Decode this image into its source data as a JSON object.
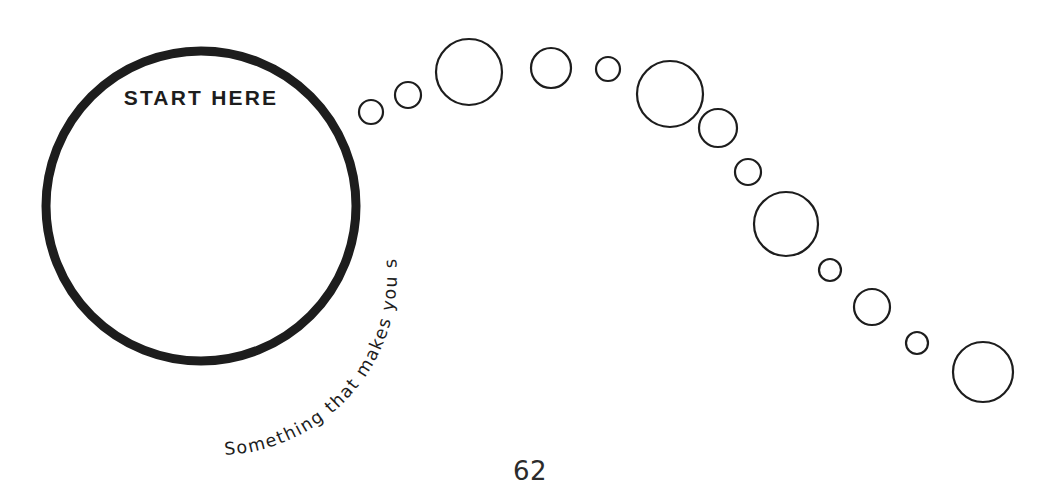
{
  "page": {
    "background_color": "#ffffff",
    "ink_color": "#1d1d1d",
    "page_number": "62"
  },
  "start_circle": {
    "label": "START HERE",
    "caption": "Something that makes you smile",
    "cx": 201,
    "cy": 206,
    "r": 155,
    "stroke_width": 9
  },
  "chart_data": {
    "type": "scatter",
    "title": "Something that makes you smile",
    "xlabel": "",
    "ylabel": "",
    "xlim": [
      0,
      1061
    ],
    "ylim": [
      0,
      500
    ],
    "grid": false,
    "legend": "none",
    "annotations": [
      "START HERE",
      "Something that makes you smile",
      "62"
    ],
    "series": [
      {
        "name": "start-circle",
        "points": [
          {
            "x": 201,
            "y": 206,
            "r": 155,
            "stroke": 9
          }
        ]
      },
      {
        "name": "bubble-trail",
        "points": [
          {
            "x": 371,
            "y": 112,
            "r": 12,
            "stroke": 2.2
          },
          {
            "x": 408,
            "y": 95,
            "r": 13,
            "stroke": 2.2
          },
          {
            "x": 469,
            "y": 72,
            "r": 33,
            "stroke": 2.2
          },
          {
            "x": 551,
            "y": 68,
            "r": 20,
            "stroke": 2.2
          },
          {
            "x": 608,
            "y": 69,
            "r": 12,
            "stroke": 2.2
          },
          {
            "x": 670,
            "y": 94,
            "r": 33,
            "stroke": 2.2
          },
          {
            "x": 718,
            "y": 128,
            "r": 19,
            "stroke": 2.2
          },
          {
            "x": 748,
            "y": 172,
            "r": 13,
            "stroke": 2.2
          },
          {
            "x": 786,
            "y": 224,
            "r": 32,
            "stroke": 2.2
          },
          {
            "x": 830,
            "y": 270,
            "r": 11,
            "stroke": 2.2
          },
          {
            "x": 872,
            "y": 307,
            "r": 18,
            "stroke": 2.2
          },
          {
            "x": 917,
            "y": 343,
            "r": 11,
            "stroke": 2.2
          },
          {
            "x": 983,
            "y": 372,
            "r": 30,
            "stroke": 2.2
          }
        ]
      }
    ]
  }
}
